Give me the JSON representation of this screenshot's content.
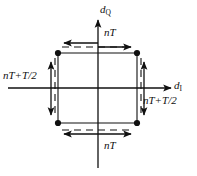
{
  "figure": {
    "name": "iq-timing-offset-diagram",
    "background": "#ffffff",
    "stroke_color": "#101010",
    "axes": {
      "vertical": {
        "label_main": "d",
        "label_sub": "Q",
        "name": "d-Q-axis"
      },
      "horizontal": {
        "label_main": "d",
        "label_sub": "I",
        "name": "d-I-axis"
      }
    },
    "annotations": {
      "top": "nT",
      "bottom": "nT",
      "left": "nT+T/2",
      "right": "nT+T/2"
    },
    "markers": {
      "count": 4,
      "positions": [
        {
          "x": 58,
          "y": 53,
          "name": "marker-top-left"
        },
        {
          "x": 137,
          "y": 53,
          "name": "marker-top-right"
        },
        {
          "x": 58,
          "y": 123,
          "name": "marker-bottom-left"
        },
        {
          "x": 137,
          "y": 123,
          "name": "marker-bottom-right"
        }
      ]
    },
    "arrows": {
      "top_pair": {
        "left_dir": "left",
        "right_dir": "right"
      },
      "bottom_pair": {
        "left_dir": "left",
        "right_dir": "right"
      },
      "left_pair": {
        "up_dir": "up",
        "down_dir": "down"
      },
      "right_pair": {
        "up_dir": "up",
        "down_dir": "down"
      }
    }
  }
}
